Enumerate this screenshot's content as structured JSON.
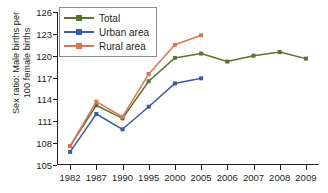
{
  "chart_data": {
    "type": "line",
    "title": "",
    "xlabel": "",
    "ylabel": "Sex ratio: Male births per\n100 female births",
    "categories": [
      "1982",
      "1987",
      "1990",
      "1995",
      "2000",
      "2005",
      "2006",
      "2007",
      "2008",
      "2009"
    ],
    "ylim": [
      105,
      126
    ],
    "yticks": [
      105,
      108,
      111,
      114,
      117,
      120,
      123,
      126
    ],
    "grid": false,
    "legend_position": "top-left",
    "series": [
      {
        "name": "Total",
        "color": "#5c7233",
        "values": [
          107.6,
          113.2,
          111.4,
          116.5,
          119.7,
          120.3,
          119.2,
          120.0,
          120.5,
          119.6
        ]
      },
      {
        "name": "Urban area",
        "color": "#3c5ba4",
        "values": [
          106.8,
          112.0,
          109.9,
          113.0,
          116.2,
          116.9,
          null,
          null,
          null,
          null
        ]
      },
      {
        "name": "Rural area",
        "color": "#e0744a",
        "values": [
          107.6,
          113.7,
          111.6,
          117.5,
          121.5,
          122.8,
          null,
          null,
          null,
          null
        ]
      }
    ]
  },
  "legend": {
    "items": [
      {
        "label": "Total",
        "color": "#5c7233"
      },
      {
        "label": "Urban area",
        "color": "#3c5ba4"
      },
      {
        "label": "Rural area",
        "color": "#e0744a"
      }
    ]
  },
  "axes": {
    "y_title": "Sex ratio: Male births per\n100 female births",
    "y_tick_labels": [
      "105",
      "108",
      "111",
      "114",
      "117",
      "120",
      "123",
      "126"
    ],
    "x_tick_labels": [
      "1982",
      "1987",
      "1990",
      "1995",
      "2000",
      "2005",
      "2006",
      "2007",
      "2008",
      "2009"
    ]
  }
}
